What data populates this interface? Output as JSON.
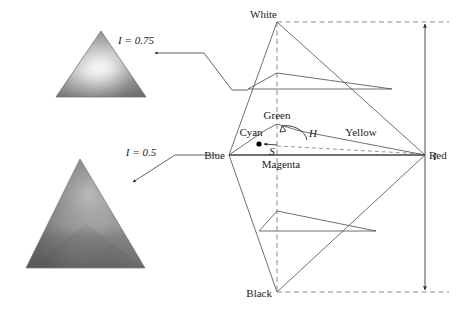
{
  "figure": {
    "axis_label": "I",
    "vertices": {
      "white": "White",
      "black": "Black",
      "red": "Red",
      "green": "Green",
      "blue": "Blue",
      "cyan": "Cyan",
      "magenta": "Magenta",
      "yellow": "Yellow"
    },
    "annotations": {
      "hue": "H",
      "saturation": "S"
    },
    "callouts": [
      {
        "label": "I = 0.75",
        "intensity": 0.75
      },
      {
        "label": "I = 0.5",
        "intensity": 0.5
      }
    ],
    "colors": {
      "line": "#4a4a52",
      "dash": "#6a6a72",
      "text": "#1a1a1a",
      "point": "#000000",
      "background": "#ffffff"
    }
  }
}
